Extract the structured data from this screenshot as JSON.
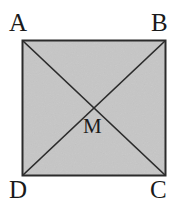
{
  "figure": {
    "background_color": "#ffffff",
    "fill_color": "#c0c0c0",
    "stroke_color": "#2b2b2b",
    "label_color": "#1a1a1a",
    "square": {
      "left": 22,
      "top": 40,
      "right": 165,
      "bottom": 175,
      "stroke_width": 2
    },
    "center": {
      "x": 93.5,
      "y": 107.5
    },
    "diagonals": [
      {
        "name": "diagonal-a-c",
        "from": "A",
        "to": "C"
      },
      {
        "name": "diagonal-b-d",
        "from": "B",
        "to": "D"
      }
    ],
    "labels": {
      "top_left": "A",
      "top_right": "B",
      "bottom_right": "C",
      "bottom_left": "D",
      "center": "M"
    }
  }
}
